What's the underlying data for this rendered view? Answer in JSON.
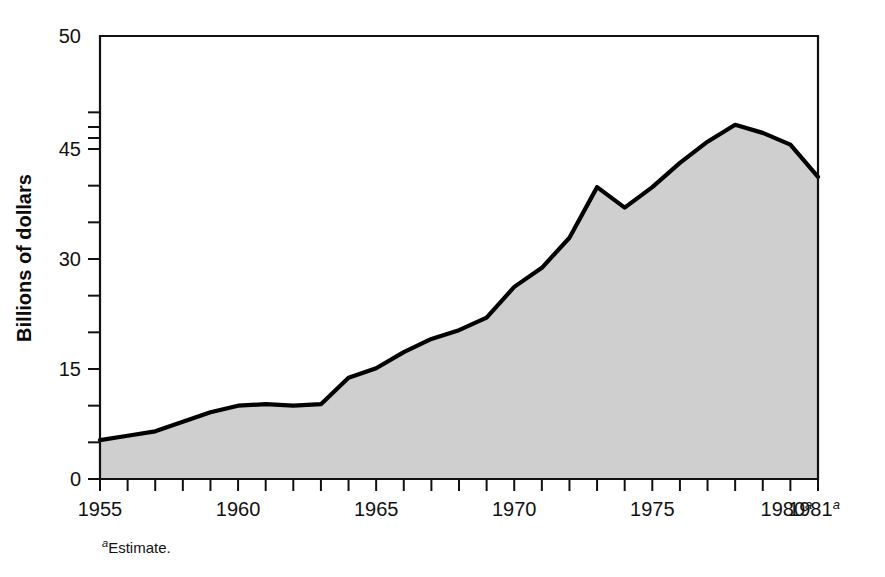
{
  "chart_data": {
    "type": "area",
    "title": "",
    "subtitle": "",
    "xlabel": "",
    "ylabel": "Billions of dollars",
    "x": [
      1955,
      1956,
      1957,
      1958,
      1959,
      1960,
      1961,
      1962,
      1963,
      1964,
      1965,
      1966,
      1967,
      1968,
      1969,
      1970,
      1971,
      1972,
      1973,
      1974,
      1975,
      1976,
      1977,
      1978,
      1979,
      1980,
      1981
    ],
    "values": [
      5.3,
      5.9,
      6.5,
      7.8,
      9.1,
      10.0,
      10.2,
      10.0,
      10.2,
      13.8,
      15.1,
      17.3,
      19.1,
      20.3,
      22.0,
      26.2,
      28.8,
      32.9,
      39.8,
      37.0,
      39.8,
      43.1,
      46.0,
      48.3,
      47.2,
      45.6,
      41.2
    ],
    "series": [
      {
        "name": "Billions of dollars",
        "values": [
          5.3,
          5.9,
          6.5,
          7.8,
          9.1,
          10.0,
          10.2,
          10.0,
          10.2,
          13.8,
          15.1,
          17.3,
          19.1,
          20.3,
          22.0,
          26.2,
          28.8,
          32.9,
          39.8,
          37.0,
          39.8,
          43.1,
          46.0,
          48.3,
          47.2,
          45.6,
          41.2
        ]
      }
    ],
    "ylim": [
      0,
      50
    ],
    "xlim": [
      1955,
      1981
    ],
    "y_tick_values": [
      0,
      15,
      30,
      45,
      50
    ],
    "y_tick_labels": [
      "0",
      "15",
      "30",
      "45",
      "50"
    ],
    "y_minor_tick_values": [
      5,
      10,
      20,
      25,
      35,
      40,
      46.5,
      48
    ],
    "x_tick_values": [
      1955,
      1956,
      1957,
      1958,
      1959,
      1960,
      1961,
      1962,
      1963,
      1964,
      1965,
      1966,
      1967,
      1968,
      1969,
      1970,
      1971,
      1972,
      1973,
      1974,
      1975,
      1976,
      1977,
      1978,
      1979,
      1980,
      1981
    ],
    "x_labeled_ticks": [
      {
        "value": 1955,
        "label": "1955",
        "superscript": ""
      },
      {
        "value": 1960,
        "label": "1960",
        "superscript": ""
      },
      {
        "value": 1965,
        "label": "1965",
        "superscript": ""
      },
      {
        "value": 1970,
        "label": "1970",
        "superscript": ""
      },
      {
        "value": 1975,
        "label": "1975",
        "superscript": ""
      },
      {
        "value": 1980,
        "label": "1980",
        "superscript": "a"
      },
      {
        "value": 1981,
        "label": "1981",
        "superscript": "a"
      }
    ],
    "grid": false,
    "legend": "none",
    "annotations": [
      {
        "name": "footnote",
        "superscript": "a",
        "text": "Estimate."
      }
    ],
    "colors": {
      "area_fill": "#cfcfcf",
      "line": "#000000",
      "axis": "#111111",
      "background": "#ffffff",
      "text": "#111111"
    }
  }
}
